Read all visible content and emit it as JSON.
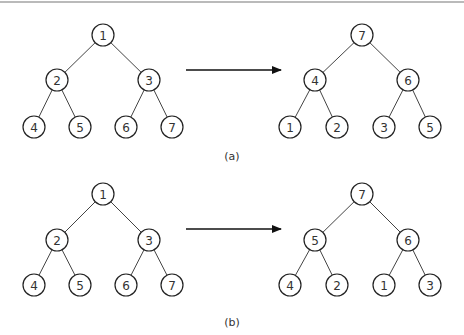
{
  "figure": {
    "panels": [
      {
        "caption": "(a)",
        "before_tree": [
          "1",
          "2",
          "3",
          "4",
          "5",
          "6",
          "7"
        ],
        "after_tree": [
          "7",
          "4",
          "6",
          "1",
          "2",
          "3",
          "5"
        ]
      },
      {
        "caption": "(b)",
        "before_tree": [
          "1",
          "2",
          "3",
          "4",
          "5",
          "6",
          "7"
        ],
        "after_tree": [
          "7",
          "5",
          "6",
          "4",
          "2",
          "1",
          "3"
        ]
      }
    ]
  },
  "colors": {
    "stroke": "#222222",
    "edge": "#444444",
    "background": "#ffffff"
  }
}
